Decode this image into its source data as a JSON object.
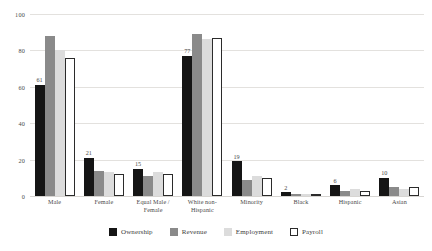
{
  "chart_data": {
    "type": "bar",
    "title": "",
    "subtitle": "",
    "xlabel": "",
    "ylabel": "",
    "ylim": [
      0,
      100
    ],
    "yticks": [
      0,
      20,
      40,
      60,
      80,
      100
    ],
    "grid": true,
    "legend_position": "bottom",
    "categories": [
      "Male",
      "Female",
      "Equal Male / Female",
      "White non-Hispanic",
      "Minority",
      "Black",
      "Hispanic",
      "Asian"
    ],
    "series": [
      {
        "name": "Ownership",
        "color": "#151515",
        "values": [
          61,
          21,
          15,
          77,
          19,
          2,
          6,
          10
        ],
        "labels": [
          "61",
          "21",
          "15",
          "77",
          "19",
          "2",
          "6",
          "10"
        ],
        "labels_shown": true
      },
      {
        "name": "Revenue",
        "color": "#8a8a8a",
        "values": [
          88,
          14,
          11,
          89,
          9,
          1,
          3,
          5
        ],
        "labels_shown": false
      },
      {
        "name": "Employment",
        "color": "#dcdcdc",
        "values": [
          80,
          13,
          13,
          86,
          11,
          1,
          4,
          4
        ],
        "labels_shown": false
      },
      {
        "name": "Payroll",
        "color": "#ffffff",
        "values": [
          76,
          12,
          12,
          87,
          10,
          1,
          3,
          5
        ],
        "labels_shown": false
      }
    ]
  },
  "axis": {
    "y_tick_labels": [
      "100",
      "80",
      "60",
      "40",
      "20",
      "0"
    ]
  },
  "legend": {
    "items": [
      {
        "label": "Ownership",
        "swatch": "black-filled-swatch"
      },
      {
        "label": "Revenue",
        "swatch": "dark-gray-filled-swatch"
      },
      {
        "label": "Employment",
        "swatch": "light-gray-filled-swatch"
      },
      {
        "label": "Payroll",
        "swatch": "white-outlined-swatch"
      }
    ]
  }
}
